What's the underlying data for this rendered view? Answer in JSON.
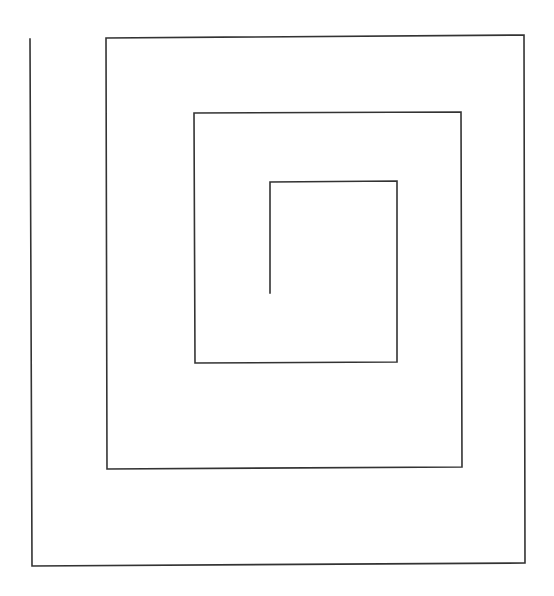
{
  "diagram": {
    "type": "square-spiral",
    "stroke_color": "#333333",
    "stroke_width": 1.6,
    "background": "#ffffff",
    "points": [
      [
        270,
        293
      ],
      [
        270,
        182
      ],
      [
        397,
        181
      ],
      [
        397,
        362
      ],
      [
        195,
        363
      ],
      [
        194,
        113
      ],
      [
        461,
        112
      ],
      [
        462,
        467
      ],
      [
        107,
        469
      ],
      [
        106,
        38
      ],
      [
        524,
        35
      ],
      [
        525,
        563
      ],
      [
        32,
        566
      ],
      [
        30,
        39
      ]
    ]
  }
}
